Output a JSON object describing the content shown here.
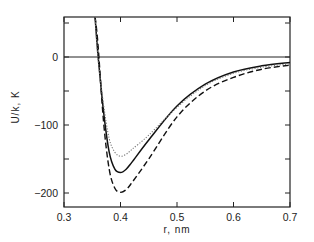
{
  "chart_data": {
    "type": "line",
    "title": "",
    "xlabel": "r, nm",
    "ylabel": "U/k, K",
    "xlim": [
      0.3,
      0.7
    ],
    "ylim": [
      -220,
      59
    ],
    "x_ticks": [
      "0.3",
      "0.4",
      "0.5",
      "0.6",
      "0.7"
    ],
    "y_ticks": [
      "0",
      "-100",
      "-200"
    ],
    "grid": false,
    "legend": null,
    "reference_line": {
      "y": 0
    },
    "x": [
      0.355,
      0.36,
      0.37,
      0.38,
      0.39,
      0.4,
      0.41,
      0.42,
      0.45,
      0.5,
      0.55,
      0.6,
      0.65,
      0.7
    ],
    "series": [
      {
        "name": "solid",
        "style": "solid",
        "values": [
          59,
          5,
          -80,
          -140,
          -165,
          -170,
          -165,
          -155,
          -122,
          -72,
          -40,
          -22,
          -13,
          -8
        ]
      },
      {
        "name": "dashed",
        "style": "dashed",
        "values": [
          59,
          20,
          -95,
          -165,
          -193,
          -199,
          -195,
          -185,
          -150,
          -88,
          -50,
          -30,
          -18,
          -12
        ]
      },
      {
        "name": "dotted",
        "style": "dotted",
        "values": [
          59,
          0,
          -70,
          -120,
          -140,
          -146,
          -143,
          -136,
          -115,
          -74,
          -42,
          -24,
          -15,
          -10
        ]
      }
    ]
  }
}
